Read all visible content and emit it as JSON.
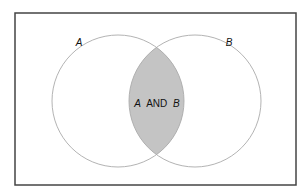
{
  "diagram": {
    "type": "venn",
    "frame": {
      "x": 15,
      "y": 13,
      "width": 281,
      "height": 172,
      "stroke": "#444444",
      "stroke_width": 1.5
    },
    "sets": [
      {
        "id": "A",
        "label": "A",
        "cx": 118,
        "cy": 101,
        "r": 66,
        "label_x": 79,
        "label_y": 46
      },
      {
        "id": "B",
        "label": "B",
        "cx": 195,
        "cy": 101,
        "r": 66,
        "label_x": 229,
        "label_y": 46
      }
    ],
    "circle_stroke": "#aaaaaa",
    "intersection": {
      "label_parts": [
        "A",
        "AND",
        "B"
      ],
      "label_x": 157,
      "label_y": 107,
      "fill": "#c4c4c4",
      "stroke": "#999999"
    }
  }
}
